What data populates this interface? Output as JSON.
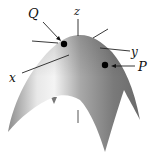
{
  "diagram": {
    "labels": {
      "z": "z",
      "y": "y",
      "x": "x",
      "Q": "Q",
      "P": "P"
    },
    "colors": {
      "surface_light": "#f2f2f2",
      "surface_mid": "#9a9a9a",
      "surface_dark": "#6a6a6a",
      "line": "#222222",
      "point": "#000000"
    }
  }
}
